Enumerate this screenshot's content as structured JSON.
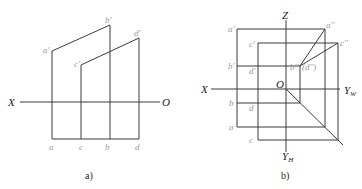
{
  "panel_a": {
    "caption": "a)",
    "axis_x_label": "X",
    "axis_o_label": "O",
    "labels": {
      "a_prime": "a'",
      "b_prime": "b'",
      "c_prime": "c'",
      "d_prime": "d'",
      "a": "a",
      "c": "c",
      "b": "b",
      "d": "d"
    }
  },
  "panel_b": {
    "caption": "b)",
    "axis_z_label": "Z",
    "axis_x_label": "X",
    "axis_o_label": "O",
    "axis_yw_label": "Y",
    "axis_yw_sub": "W",
    "axis_yh_label": "Y",
    "axis_yh_sub": "H",
    "labels": {
      "a_prime": "a'",
      "c_prime": "c'",
      "b_prime": "b'",
      "d_prime": "d'",
      "b": "b",
      "d": "d",
      "a": "a",
      "c": "c",
      "a_dprime": "a''",
      "c_dprime": "c''",
      "b_dprime": "b''",
      "d_dprime": "(d'')"
    }
  }
}
